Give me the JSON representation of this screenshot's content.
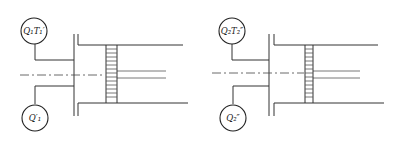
{
  "diagrams": [
    {
      "id": "left",
      "top_circle_label": "Q₁T₁′",
      "bottom_circle_label": "Q′₁"
    },
    {
      "id": "right",
      "top_circle_label": "Q₂T₂″",
      "bottom_circle_label": "Q₂″"
    }
  ],
  "colors": {
    "line": "#333333",
    "background": "#ffffff"
  }
}
